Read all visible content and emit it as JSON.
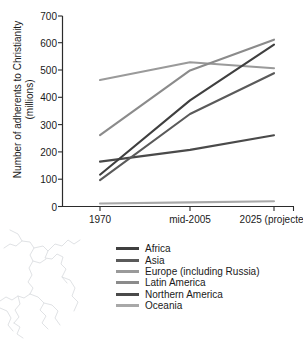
{
  "chart_data": {
    "type": "line",
    "title": "",
    "xlabel": "",
    "ylabel": "Number of adherents to Christianity\n(millions)",
    "categories": [
      "1970",
      "mid-2005",
      "2025 (projected)"
    ],
    "x_tick_labels": [
      "1970",
      "mid-2005",
      "2025 (projected)"
    ],
    "y_tick_labels": [
      "0",
      "100",
      "200",
      "300",
      "400",
      "500",
      "600",
      "700"
    ],
    "y_ticks": [
      0,
      100,
      200,
      300,
      400,
      500,
      600,
      700
    ],
    "ylim": [
      0,
      700
    ],
    "grid": false,
    "legend_position": "below-center",
    "series": [
      {
        "name": "Africa",
        "values": [
          117,
          390,
          595
        ],
        "color": "#3f3f3f"
      },
      {
        "name": "Asia",
        "values": [
          97,
          340,
          490
        ],
        "color": "#5a5a5a"
      },
      {
        "name": "Europe (including Russia)",
        "values": [
          465,
          530,
          508
        ],
        "color": "#9a9a9a"
      },
      {
        "name": "Latin America",
        "values": [
          262,
          500,
          613
        ],
        "color": "#8b8b8b"
      },
      {
        "name": "Northern America",
        "values": [
          165,
          208,
          262
        ],
        "color": "#4a4a4a"
      },
      {
        "name": "Oceania",
        "values": [
          11,
          15,
          19
        ],
        "color": "#a8a8a8"
      }
    ]
  },
  "legend": {
    "items": [
      {
        "label": "Africa"
      },
      {
        "label": "Asia"
      },
      {
        "label": "Europe (including Russia)"
      },
      {
        "label": "Latin America"
      },
      {
        "label": "Northern America"
      },
      {
        "label": "Oceania"
      }
    ]
  },
  "colors": {
    "axis": "#2b2b2b",
    "text": "#1a1a1a",
    "background": "#ffffff",
    "watermark": "#c9cdd1"
  }
}
